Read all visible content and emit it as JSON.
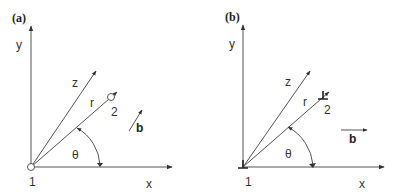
{
  "colors": {
    "line": "#555555",
    "text": "#333333",
    "background": "#ffffff"
  },
  "panels": [
    {
      "id": "a",
      "title": "(a)",
      "axis_y_label": "y",
      "axis_x_label": "x",
      "z_label": "z",
      "r_label": "r",
      "theta_label": "θ",
      "point1_label": "1",
      "point2_label": "2",
      "vector_b_label": "b",
      "point_marker": "open-circle",
      "b_direction": "diagonal"
    },
    {
      "id": "b",
      "title": "(b)",
      "axis_y_label": "y",
      "axis_x_label": "x",
      "z_label": "z",
      "r_label": "r",
      "theta_label": "θ",
      "point1_label": "1",
      "point2_label": "2",
      "vector_b_label": "b",
      "point_marker": "L-shaped-marker",
      "b_direction": "horizontal"
    }
  ]
}
